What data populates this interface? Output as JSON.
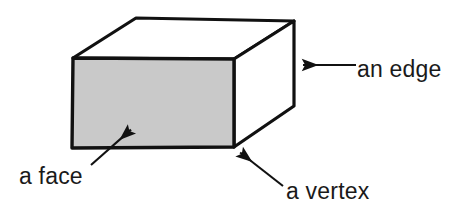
{
  "figure": {
    "kind": "geometry-diagram",
    "background_color": "#ffffff",
    "stroke_color": "#111111",
    "front_face_fill": "#c9c9c9",
    "other_face_fill": "#ffffff",
    "text_color": "#1a1a1a",
    "solid": {
      "name": "cuboid",
      "front_face": [
        [
          73,
          58
        ],
        [
          234,
          59
        ],
        [
          234,
          147
        ],
        [
          72,
          148
        ]
      ],
      "top_back_left": [
        136,
        18
      ],
      "top_back_right": [
        294,
        21
      ],
      "back_bottom_right": [
        294,
        106
      ]
    },
    "labels": [
      {
        "id": "edge",
        "text": "an edge",
        "text_x": 357,
        "text_y": 77,
        "arrow_tail": [
          356,
          65
        ],
        "arrow_tip": [
          299,
          65
        ]
      },
      {
        "id": "face",
        "text": "a face",
        "text_x": 19,
        "text_y": 184,
        "arrow_tail": [
          91,
          165
        ],
        "arrow_tip": [
          134,
          127
        ]
      },
      {
        "id": "vertex",
        "text": "a vertex",
        "text_x": 286,
        "text_y": 199,
        "arrow_tail": [
          283,
          186
        ],
        "arrow_tip": [
          237,
          150
        ]
      }
    ]
  }
}
